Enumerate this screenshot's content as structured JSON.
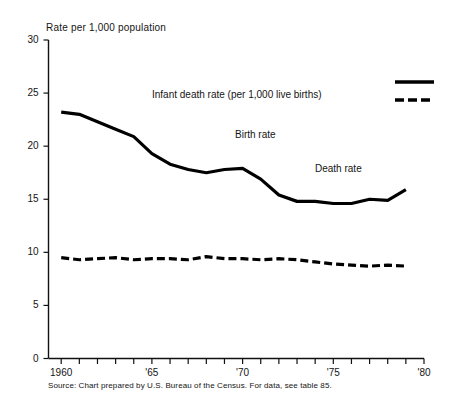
{
  "chart_data": {
    "type": "line",
    "title": "",
    "ylabel": "Rate per 1,000 population",
    "xlabel": "",
    "ylim": [
      0,
      30
    ],
    "xlim": [
      1959.3,
      1980
    ],
    "yticks": [
      0,
      5,
      10,
      15,
      20,
      25,
      30
    ],
    "ytick_labels": [
      "0",
      "5",
      "10",
      "15",
      "20",
      "25",
      "30"
    ],
    "xticks": [
      1960,
      1961,
      1962,
      1963,
      1964,
      1965,
      1966,
      1967,
      1968,
      1969,
      1970,
      1971,
      1972,
      1973,
      1974,
      1975,
      1976,
      1977,
      1978,
      1979,
      1980
    ],
    "xtick_labels": [
      "1960",
      "",
      "",
      "",
      "",
      "'65",
      "",
      "",
      "",
      "",
      "'70",
      "",
      "",
      "",
      "",
      "'75",
      "",
      "",
      "",
      "",
      "'80"
    ],
    "grid": false,
    "legend_position": "top-right",
    "x": [
      1960,
      1961,
      1962,
      1963,
      1964,
      1965,
      1966,
      1967,
      1968,
      1969,
      1970,
      1971,
      1972,
      1973,
      1974,
      1975,
      1976,
      1977,
      1978,
      1979
    ],
    "series": [
      {
        "name": "Birth rate",
        "style": "solid",
        "color": "#000000",
        "values": [
          23.2,
          23.0,
          22.3,
          21.6,
          20.9,
          19.3,
          18.3,
          17.8,
          17.5,
          17.8,
          17.9,
          16.9,
          15.4,
          14.8,
          14.8,
          14.6,
          14.6,
          15.0,
          14.9,
          15.9
        ]
      },
      {
        "name": "Death rate",
        "style": "dashed",
        "color": "#000000",
        "values": [
          9.5,
          9.3,
          9.4,
          9.5,
          9.3,
          9.4,
          9.4,
          9.3,
          9.6,
          9.4,
          9.4,
          9.3,
          9.4,
          9.3,
          9.1,
          8.9,
          8.8,
          8.7,
          8.8,
          8.7
        ]
      }
    ],
    "annotations": [
      {
        "text": "Infant death rate (per 1,000 live births)",
        "x_px": 152,
        "y_px": 89
      },
      {
        "text": "Birth rate",
        "x_px": 235,
        "y_px": 129
      },
      {
        "text": "Death rate",
        "x_px": 315,
        "y_px": 163
      }
    ],
    "legend_entries": [
      {
        "label": "",
        "style": "solid"
      },
      {
        "label": "",
        "style": "dashed"
      }
    ],
    "source": "Source: Chart prepared by U.S. Bureau of the Census. For data, see table 85."
  }
}
